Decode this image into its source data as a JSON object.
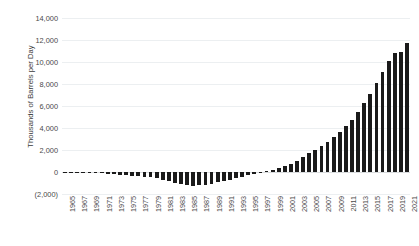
{
  "chart_data": {
    "type": "bar",
    "title": "",
    "subtitle": "",
    "xlabel": "",
    "ylabel": "Thousands of Barrels per Day",
    "ylim": [
      -2000,
      14000
    ],
    "ytick_step": 2000,
    "ytick_labels": [
      "14,000",
      "12,000",
      "10,000",
      "8,000",
      "6,000",
      "4,000",
      "2,000",
      "0",
      "(2,000)"
    ],
    "ytick_values": [
      14000,
      12000,
      10000,
      8000,
      6000,
      4000,
      2000,
      0,
      -2000
    ],
    "xtick_labels": [
      "1965",
      "1967",
      "1969",
      "1971",
      "1973",
      "1975",
      "1977",
      "1979",
      "1981",
      "1983",
      "1985",
      "1987",
      "1989",
      "1991",
      "1993",
      "1995",
      "1997",
      "1999",
      "2001",
      "2003",
      "2005",
      "2007",
      "2009",
      "2011",
      "2013",
      "2015",
      "2017",
      "2019",
      "2021"
    ],
    "grid": true,
    "legend": "none",
    "bar_color": "#1a1a1a",
    "grid_color": "#eceff1",
    "categories": [
      "1965",
      "1966",
      "1967",
      "1968",
      "1969",
      "1970",
      "1971",
      "1972",
      "1973",
      "1974",
      "1975",
      "1976",
      "1977",
      "1978",
      "1979",
      "1980",
      "1981",
      "1982",
      "1983",
      "1984",
      "1985",
      "1986",
      "1987",
      "1988",
      "1989",
      "1990",
      "1991",
      "1992",
      "1993",
      "1994",
      "1995",
      "1996",
      "1997",
      "1998",
      "1999",
      "2000",
      "2001",
      "2002",
      "2003",
      "2004",
      "2005",
      "2006",
      "2007",
      "2008",
      "2009",
      "2010",
      "2011",
      "2012",
      "2013",
      "2014",
      "2015",
      "2016",
      "2017",
      "2018",
      "2019",
      "2020",
      "2021"
    ],
    "values": [
      -10,
      -15,
      -20,
      -30,
      -60,
      -70,
      -110,
      -150,
      -190,
      -230,
      -280,
      -330,
      -380,
      -430,
      -480,
      -560,
      -700,
      -860,
      -1000,
      -1080,
      -1180,
      -1230,
      -1210,
      -1150,
      -1060,
      -950,
      -840,
      -700,
      -580,
      -430,
      -290,
      -150,
      -40,
      60,
      160,
      330,
      520,
      700,
      1000,
      1350,
      1700,
      2000,
      2350,
      2700,
      3150,
      3600,
      4150,
      4750,
      5450,
      6250,
      7100,
      8050,
      9050,
      10050,
      10850,
      10950,
      11700
    ]
  }
}
